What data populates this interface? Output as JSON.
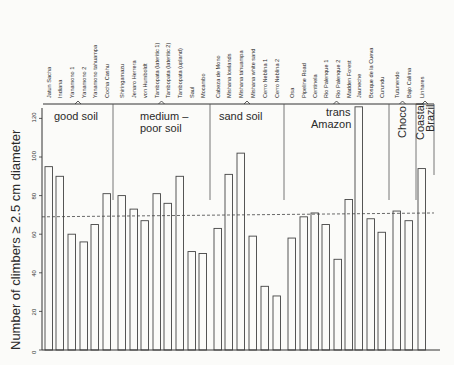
{
  "chart_data": {
    "type": "bar",
    "title": "",
    "ylabel": "Number of climbers ≥ 2.5 cm diameter",
    "xlabel": "",
    "ylim": [
      0,
      130
    ],
    "yticks": [
      0,
      20,
      40,
      60,
      80,
      100,
      120
    ],
    "grid": false,
    "reference_line": {
      "value": 69,
      "style": "dashed"
    },
    "categories": [
      "Jatun Sacha",
      "Indiana",
      "Yanamono 1",
      "Yanamono 2",
      "Yanamono tahuampa",
      "Cocha Cashu",
      "Shiringamazu",
      "Jenaro Herrera",
      "von Humboldt",
      "Tambopata (lateritic 1)",
      "Tambopata (lateritic 2)",
      "Tambopata (upland)",
      "Saul",
      "Mocambo",
      "Cabeza de Mono",
      "Mishana lowlands",
      "Mishana tahuampa",
      "Mishana white sand",
      "Cerro Neblina 1",
      "Cerro Neblina 2",
      "Osa",
      "Pipeline Road",
      "Centinela",
      "Rio Palenque 1",
      "Rio Palenque 2",
      "Madden Forest",
      "Jauneche",
      "Bosque de la Cueva",
      "Curundu",
      "Tutunendo",
      "Bajo Calima",
      "Linhares"
    ],
    "values": [
      95,
      90,
      60,
      56,
      65,
      81,
      80,
      73,
      67,
      81,
      76,
      90,
      51,
      50,
      63,
      91,
      102,
      59,
      33,
      28,
      58,
      69,
      71,
      65,
      47,
      78,
      126,
      68,
      61,
      72,
      67,
      94
    ],
    "groups": [
      {
        "label": "good soil",
        "start": 0,
        "end": 5
      },
      {
        "label": "medium – poor soil",
        "start": 6,
        "end": 13
      },
      {
        "label": "sand soil",
        "start": 14,
        "end": 19
      },
      {
        "label": "trans Amazon",
        "start": 20,
        "end": 28
      },
      {
        "label": "Choco",
        "start": 29,
        "end": 30
      },
      {
        "label": "Coastal Brazil",
        "start": 31,
        "end": 31
      }
    ]
  }
}
